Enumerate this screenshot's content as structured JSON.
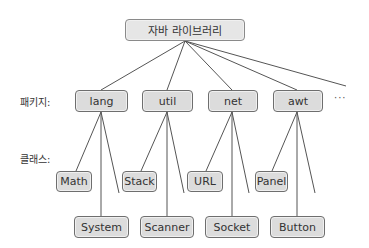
{
  "root": {
    "label": "자바 라이브러리"
  },
  "row_labels": {
    "packages": "패키지:",
    "classes": "클래스:"
  },
  "packages": [
    {
      "name": "lang",
      "classes": [
        "Math",
        "System"
      ]
    },
    {
      "name": "util",
      "classes": [
        "Stack",
        "Scanner"
      ]
    },
    {
      "name": "net",
      "classes": [
        "URL",
        "Socket"
      ]
    },
    {
      "name": "awt",
      "classes": [
        "Panel",
        "Button"
      ]
    }
  ],
  "more_packages": "···",
  "colors": {
    "node_fill": "#dcdcdc",
    "node_border": "#6e6e6e",
    "line": "#555555"
  }
}
